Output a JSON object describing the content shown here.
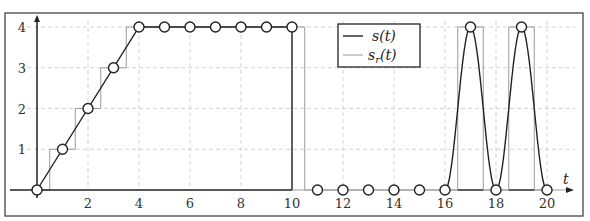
{
  "chart_data": {
    "type": "line",
    "title": "",
    "xlabel": "t",
    "ylabel": "",
    "xlim": [
      0,
      20
    ],
    "ylim": [
      0,
      4
    ],
    "grid": true,
    "legend_position": "top-center",
    "x_ticks": [
      2,
      4,
      6,
      8,
      10,
      12,
      14,
      16,
      18,
      20
    ],
    "y_ticks": [
      1,
      2,
      3,
      4
    ],
    "series": [
      {
        "name": "s(t)",
        "color": "#222222",
        "style": "solid dark line with sample circles",
        "samples": {
          "x": [
            0,
            1,
            2,
            3,
            4,
            5,
            6,
            7,
            8,
            9,
            10,
            11,
            12,
            13,
            14,
            15,
            16,
            17,
            18,
            19,
            20
          ],
          "y": [
            0,
            1,
            2,
            3,
            4,
            4,
            4,
            4,
            4,
            4,
            4,
            0,
            0,
            0,
            0,
            0,
            0,
            4,
            0,
            4,
            0
          ]
        },
        "notes": "Linear ramp 0→4 over t∈[0,4], constant 4 to t=10, drops to 0 at t=10, zero through 16, then smooth oscillation peaking at 17 and 19"
      },
      {
        "name": "s_r(t)",
        "color": "#9a9a9a",
        "style": "light gray zero-order-hold staircase",
        "x": [
          0,
          0.5,
          0.5,
          1.5,
          1.5,
          2.5,
          2.5,
          3.5,
          3.5,
          10.5,
          10.5,
          16.5,
          16.5,
          17.5,
          17.5,
          18.5,
          18.5,
          19.5,
          19.5,
          20
        ],
        "y": [
          0,
          0,
          1,
          1,
          2,
          2,
          3,
          3,
          4,
          4,
          0,
          0,
          4,
          4,
          0,
          0,
          4,
          4,
          0,
          0
        ]
      }
    ]
  },
  "legend": {
    "s_label": "s(t)",
    "sr_label": "s",
    "sr_sub": "r",
    "sr_suffix": "(t)"
  },
  "axes": {
    "x_label": "t",
    "x_ticks": [
      "2",
      "4",
      "6",
      "8",
      "10",
      "12",
      "14",
      "16",
      "18",
      "20"
    ],
    "y_ticks": [
      "1",
      "2",
      "3",
      "4"
    ]
  }
}
